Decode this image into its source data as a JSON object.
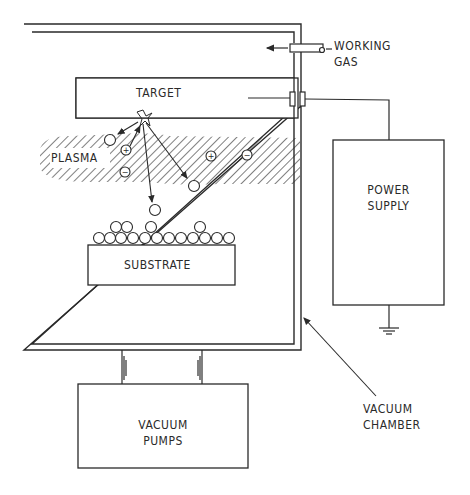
{
  "diagram": {
    "type": "sputtering-system-schematic",
    "labels": {
      "target": "TARGET",
      "plasma": "PLASMA",
      "substrate": "SUBSTRATE",
      "working_gas_line1": "WORKING",
      "working_gas_line2": "GAS",
      "power_supply_line1": "POWER",
      "power_supply_line2": "SUPPLY",
      "vacuum_pumps_line1": "VACUUM",
      "vacuum_pumps_line2": "PUMPS",
      "vacuum_chamber_line1": "VACUUM",
      "vacuum_chamber_line2": "CHAMBER"
    },
    "particles": {
      "positive_ions": [
        "+",
        "+"
      ],
      "negative_ions": [
        "−",
        "−"
      ]
    },
    "colors": {
      "line": "#2a2a2a",
      "background": "#ffffff"
    }
  }
}
